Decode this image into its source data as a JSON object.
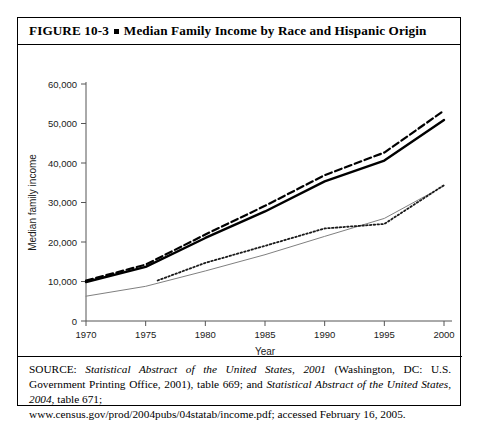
{
  "figure": {
    "number_label": "FIGURE 10-3",
    "bullet": "square-bullet",
    "title": "Median Family Income by Race and Hispanic Origin"
  },
  "source": {
    "prefix": "SOURCE:",
    "work_1": "Statistical Abstract of the United States, 2001",
    "mid_1": "(Washington, DC: U.S. Government Printing Office, 2001), table 669; and",
    "work_2": "Statistical Abstract of the United States, 2004",
    "mid_2": ", table 671;",
    "url_line": "www.census.gov/prod/2004pubs/04statab/income.pdf; accessed February 16, 2005.",
    "full_text": "SOURCE: Statistical Abstract of the United States, 2001 (Washington, DC: U.S. Government Printing Office, 2001), table 669; and Statistical Abstract of the United States, 2004, table 671; www.census.gov/prod/2004pubs/04statab/income.pdf; accessed February 16, 2005."
  },
  "chart_data": {
    "type": "line",
    "title": "Median Family Income by Race and Hispanic Origin",
    "xlabel": "Year",
    "ylabel": "Median family income",
    "xlim": [
      1970,
      2000
    ],
    "ylim": [
      0,
      60000
    ],
    "xticks": [
      1970,
      1975,
      1980,
      1985,
      1990,
      1995,
      2000
    ],
    "xtick_labels": [
      "1970",
      "1975",
      "1980",
      "1985",
      "1990",
      "1995",
      "2000"
    ],
    "yticks": [
      0,
      10000,
      20000,
      30000,
      40000,
      50000,
      60000
    ],
    "ytick_labels": [
      "0",
      "10,000",
      "20,000",
      "30,000",
      "40,000",
      "50,000",
      "60,000"
    ],
    "grid": false,
    "legend_position": "bottom",
    "series": [
      {
        "name": "All",
        "style": "solid-thick",
        "color": "#000000",
        "x": [
          1970,
          1975,
          1980,
          1985,
          1990,
          1995,
          2000
        ],
        "values": [
          9867,
          13719,
          21023,
          27735,
          35353,
          40611,
          50890
        ]
      },
      {
        "name": "White",
        "style": "dashed",
        "color": "#000000",
        "x": [
          1970,
          1975,
          1980,
          1985,
          1990,
          1995,
          2000
        ],
        "values": [
          10236,
          14268,
          21904,
          29152,
          36915,
          42646,
          53256
        ]
      },
      {
        "name": "African American",
        "style": "solid-thin",
        "color": "#808080",
        "x": [
          1970,
          1975,
          1980,
          1985,
          1990,
          1995,
          2000
        ],
        "values": [
          6279,
          8779,
          12674,
          16786,
          21423,
          25970,
          34192
        ]
      },
      {
        "name": "Hispanic",
        "style": "dotted",
        "color": "#1a1a1a",
        "x": [
          1976,
          1980,
          1985,
          1990,
          1995,
          2000
        ],
        "values": [
          10259,
          14716,
          19027,
          23431,
          24570,
          34397
        ]
      }
    ]
  }
}
